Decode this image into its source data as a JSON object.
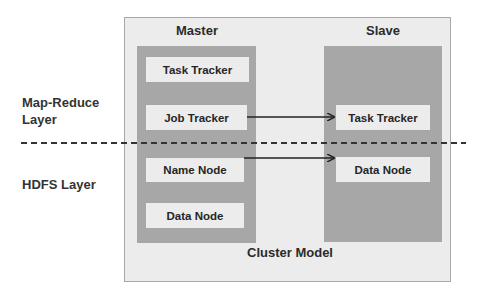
{
  "diagram": {
    "caption": "Cluster Model",
    "layers": {
      "top": {
        "line1": "Map-Reduce",
        "line2": "Layer"
      },
      "bottom": {
        "label": "HDFS Layer"
      }
    },
    "master": {
      "title": "Master",
      "components": [
        {
          "label": "Task Tracker"
        },
        {
          "label": "Job Tracker"
        },
        {
          "label": "Name Node"
        },
        {
          "label": "Data Node"
        }
      ]
    },
    "slave": {
      "title": "Slave",
      "components": [
        {
          "label": "Task Tracker"
        },
        {
          "label": "Data Node"
        }
      ]
    },
    "connections": [
      {
        "from": "Master / Job Tracker",
        "to": "Slave / Task Tracker"
      },
      {
        "from": "Master / Name Node",
        "to": "Slave / Data Node"
      }
    ],
    "colors": {
      "outer_background": "#ececec",
      "panel_background": "#a7a7a7",
      "box_background": "#ececec",
      "text": "#262626",
      "divider": "#333333"
    }
  }
}
